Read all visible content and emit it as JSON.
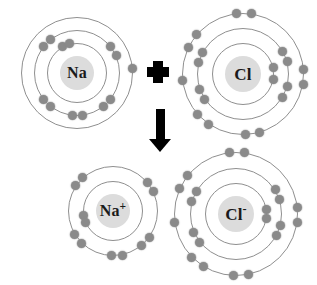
{
  "diagram": {
    "background_color": "#ffffff",
    "electron_color": "#8a8a8a",
    "shell_color": "#8f8f8f",
    "nucleus_color": "#dcdcdc",
    "symbol_color": "#000000"
  },
  "symbols": {
    "plus": "+",
    "arrow": "↓"
  },
  "reactants": {
    "sodium": {
      "label": "Na",
      "charge": "",
      "cx": 77,
      "cy": 73,
      "nucleus_r": 17,
      "shells": [
        {
          "r": 30,
          "electrons": 2
        },
        {
          "r": 43,
          "electrons": 8
        },
        {
          "r": 56,
          "electrons": 1
        }
      ],
      "electron_positions": [
        {
          "shell": 0,
          "angle": 118
        },
        {
          "shell": 0,
          "angle": 104
        },
        {
          "shell": 1,
          "angle": 128
        },
        {
          "shell": 1,
          "angle": 142
        },
        {
          "shell": 1,
          "angle": 38
        },
        {
          "shell": 1,
          "angle": 24
        },
        {
          "shell": 1,
          "angle": 218
        },
        {
          "shell": 1,
          "angle": 232
        },
        {
          "shell": 1,
          "angle": 308
        },
        {
          "shell": 1,
          "angle": 322
        },
        {
          "shell": 1,
          "angle": 264
        },
        {
          "shell": 1,
          "angle": 278
        },
        {
          "shell": 2,
          "angle": 5
        }
      ]
    },
    "chlorine": {
      "label": "Cl",
      "charge": "",
      "cx": 243,
      "cy": 74,
      "nucleus_r": 18,
      "shells": [
        {
          "r": 31,
          "electrons": 2
        },
        {
          "r": 46,
          "electrons": 8
        },
        {
          "r": 61,
          "electrons": 7
        }
      ],
      "electron_positions": [
        {
          "shell": 0,
          "angle": 12
        },
        {
          "shell": 0,
          "angle": 350
        },
        {
          "shell": 1,
          "angle": 30
        },
        {
          "shell": 1,
          "angle": 16
        },
        {
          "shell": 1,
          "angle": 152
        },
        {
          "shell": 1,
          "angle": 166
        },
        {
          "shell": 1,
          "angle": 200
        },
        {
          "shell": 1,
          "angle": 214
        },
        {
          "shell": 1,
          "angle": 330
        },
        {
          "shell": 1,
          "angle": 344
        },
        {
          "shell": 2,
          "angle": 96
        },
        {
          "shell": 2,
          "angle": 82
        },
        {
          "shell": 2,
          "angle": 140
        },
        {
          "shell": 2,
          "angle": 154
        },
        {
          "shell": 2,
          "angle": 186
        },
        {
          "shell": 2,
          "angle": 222
        },
        {
          "shell": 2,
          "angle": 236
        },
        {
          "shell": 2,
          "angle": 272
        },
        {
          "shell": 2,
          "angle": 286
        },
        {
          "shell": 2,
          "angle": 350
        },
        {
          "shell": 2,
          "angle": 4
        }
      ]
    }
  },
  "products": {
    "sodium_ion": {
      "label": "Na",
      "charge": "+",
      "cx": 113,
      "cy": 211,
      "nucleus_r": 17,
      "shells": [
        {
          "r": 30,
          "electrons": 2
        },
        {
          "r": 45,
          "electrons": 8
        }
      ],
      "electron_positions": [
        {
          "shell": 0,
          "angle": 188
        },
        {
          "shell": 0,
          "angle": 202
        },
        {
          "shell": 1,
          "angle": 132
        },
        {
          "shell": 1,
          "angle": 146
        },
        {
          "shell": 1,
          "angle": 40
        },
        {
          "shell": 1,
          "angle": 26
        },
        {
          "shell": 1,
          "angle": 212
        },
        {
          "shell": 1,
          "angle": 226
        },
        {
          "shell": 1,
          "angle": 310
        },
        {
          "shell": 1,
          "angle": 324
        },
        {
          "shell": 1,
          "angle": 268
        },
        {
          "shell": 1,
          "angle": 282
        }
      ]
    },
    "chloride_ion": {
      "label": "Cl",
      "charge": "-",
      "cx": 236,
      "cy": 214,
      "nucleus_r": 18,
      "shells": [
        {
          "r": 31,
          "electrons": 2
        },
        {
          "r": 46,
          "electrons": 8
        },
        {
          "r": 62,
          "electrons": 8
        }
      ],
      "electron_positions": [
        {
          "shell": 0,
          "angle": 8
        },
        {
          "shell": 0,
          "angle": 352
        },
        {
          "shell": 1,
          "angle": 32
        },
        {
          "shell": 1,
          "angle": 18
        },
        {
          "shell": 1,
          "angle": 150
        },
        {
          "shell": 1,
          "angle": 164
        },
        {
          "shell": 1,
          "angle": 204
        },
        {
          "shell": 1,
          "angle": 218
        },
        {
          "shell": 1,
          "angle": 332
        },
        {
          "shell": 1,
          "angle": 346
        },
        {
          "shell": 2,
          "angle": 96
        },
        {
          "shell": 2,
          "angle": 82
        },
        {
          "shell": 2,
          "angle": 142
        },
        {
          "shell": 2,
          "angle": 156
        },
        {
          "shell": 2,
          "angle": 188
        },
        {
          "shell": 2,
          "angle": 224
        },
        {
          "shell": 2,
          "angle": 238
        },
        {
          "shell": 2,
          "angle": 268
        },
        {
          "shell": 2,
          "angle": 282
        },
        {
          "shell": 2,
          "angle": 352
        },
        {
          "shell": 2,
          "angle": 6
        }
      ]
    }
  },
  "operators": {
    "plus_sign": {
      "cx": 158,
      "cy": 72,
      "arm": 11,
      "thickness": 10
    },
    "down_arrow": {
      "cx": 160,
      "cy": 130,
      "shaft_w": 9,
      "shaft_h": 30,
      "total_h": 43
    }
  }
}
